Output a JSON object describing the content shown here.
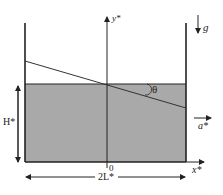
{
  "diagram": {
    "labels": {
      "y_axis": "y*",
      "x_axis": "x*",
      "gravity": "g",
      "angle": "θ",
      "height": "H*",
      "width": "2L*",
      "acceleration": "a*",
      "origin": "0"
    },
    "colors": {
      "fluid": "#a9a9a9",
      "stroke": "#222222"
    }
  }
}
